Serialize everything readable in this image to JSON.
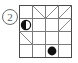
{
  "figure": {
    "label": "2",
    "label_style": "circled-number",
    "colors": {
      "grid_line": "#7a7a7a",
      "grid_border": "#4a4a4a",
      "diagonal_line": "#8a8a8a",
      "filled_circle": "#111111",
      "half_circle": "#111111",
      "label_text": "#5a5a5a",
      "label_ring": "#6b6b6b",
      "background": "#ffffff"
    },
    "grid": {
      "rows": 4,
      "cols": 4,
      "cell_size": 13,
      "origin_x": 19,
      "origin_y": 5
    },
    "markers": [
      {
        "name": "half-filled-circle",
        "shape": "half-circle",
        "row": 2,
        "col": 1,
        "radius": 4.6,
        "filled_side": "left"
      },
      {
        "name": "filled-circle",
        "shape": "circle",
        "row": 4,
        "col": 3,
        "radius": 4.4,
        "filled_side": "all"
      }
    ],
    "diagonals": [
      {
        "name": "diagonal-r1c2",
        "row": 1,
        "col": 2,
        "direction": "tl-br"
      },
      {
        "name": "diagonal-r1c3",
        "row": 1,
        "col": 3,
        "direction": "bl-tr"
      },
      {
        "name": "diagonal-r1c4",
        "row": 1,
        "col": 4,
        "direction": "bl-tr"
      },
      {
        "name": "diagonal-r2c4",
        "row": 2,
        "col": 4,
        "direction": "bl-tr"
      },
      {
        "name": "diagonal-r3c1",
        "row": 3,
        "col": 1,
        "direction": "tl-br"
      }
    ]
  }
}
